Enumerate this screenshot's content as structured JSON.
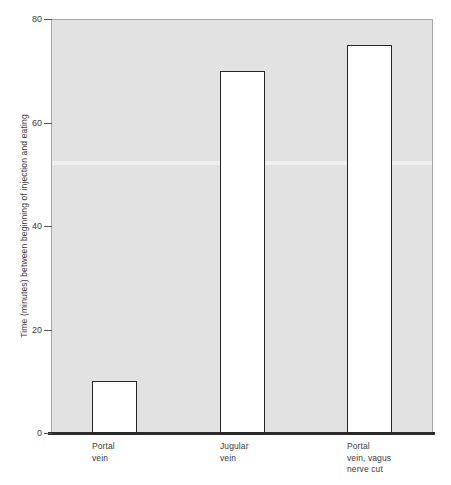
{
  "chart_data": {
    "type": "bar",
    "title": "",
    "xlabel": "",
    "ylabel": "Time (minutes) between beginning of injection and eating",
    "categories": [
      "Portal\nvein",
      "Jugular\nvein",
      "Portal\nvein, vagus\nnerve cut"
    ],
    "values": [
      10,
      70,
      75
    ],
    "ylim": [
      0,
      80
    ],
    "yticks": [
      0,
      20,
      40,
      60,
      80
    ],
    "ytick_labels": [
      "0",
      "20",
      "40",
      "60",
      "80"
    ],
    "grid": false,
    "legend": null,
    "bar_fill_color": "#ffffff",
    "bar_edge_color": "#262626",
    "plot_background_color": "#e2e2e2",
    "axis_color": "#2b2b2b"
  },
  "axis": {
    "y_title": "Time (minutes) between beginning of injection and eating",
    "ticks": [
      {
        "label": "80",
        "value": 80
      },
      {
        "label": "60",
        "value": 60
      },
      {
        "label": "40",
        "value": 40
      },
      {
        "label": "20",
        "value": 20
      },
      {
        "label": "0",
        "value": 0
      }
    ]
  },
  "bars": [
    {
      "label": "Portal\nvein",
      "value": 10
    },
    {
      "label": "Jugular\nvein",
      "value": 70
    },
    {
      "label": "Portal\nvein, vagus\nnerve cut",
      "value": 75
    }
  ]
}
